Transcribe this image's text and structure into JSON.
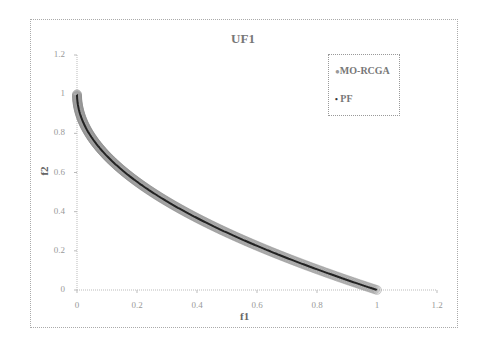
{
  "chart_data": {
    "type": "scatter",
    "title": "UF1",
    "xlabel": "f1",
    "ylabel": "f2",
    "xlim": [
      0,
      1.2
    ],
    "ylim": [
      0,
      1.2
    ],
    "x_ticks": [
      "0",
      "0.2",
      "0.4",
      "0.6",
      "0.8",
      "1",
      "1.2"
    ],
    "y_ticks": [
      "0",
      "0.2",
      "0.4",
      "0.6",
      "0.8",
      "1",
      "1.2"
    ],
    "grid": false,
    "legend_position": "upper right",
    "series": [
      {
        "name": "MO-RCGA",
        "marker": "circle",
        "color": "#999999",
        "x": [
          0,
          0.01,
          0.02,
          0.04,
          0.06,
          0.09,
          0.12,
          0.16,
          0.2,
          0.25,
          0.3,
          0.36,
          0.42,
          0.49,
          0.56,
          0.64,
          0.72,
          0.81,
          0.9,
          1.0
        ],
        "y": [
          1.0,
          0.9,
          0.859,
          0.8,
          0.755,
          0.7,
          0.654,
          0.6,
          0.553,
          0.5,
          0.452,
          0.4,
          0.352,
          0.3,
          0.252,
          0.2,
          0.151,
          0.1,
          0.051,
          0.0
        ]
      },
      {
        "name": "PF",
        "marker": "line",
        "color": "#222222",
        "formula": "f2 = 1 - sqrt(f1)",
        "x": [
          0,
          0.01,
          0.04,
          0.09,
          0.16,
          0.25,
          0.36,
          0.49,
          0.64,
          0.81,
          1.0
        ],
        "y": [
          1.0,
          0.9,
          0.8,
          0.7,
          0.6,
          0.5,
          0.4,
          0.3,
          0.2,
          0.1,
          0.0
        ]
      }
    ]
  },
  "legend": {
    "items": [
      {
        "marker": "●",
        "label": "MO-RCGA"
      },
      {
        "marker": "•",
        "label": "PF"
      }
    ]
  }
}
